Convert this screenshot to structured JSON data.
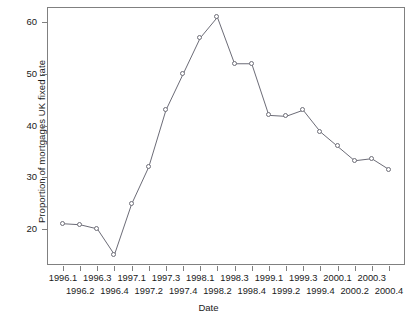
{
  "chart_data": {
    "type": "line",
    "title": "",
    "xlabel": "Date",
    "ylabel": "Proportion of mortgages UK fixed rate",
    "categories": [
      "1996.1",
      "1996.2",
      "1996.3",
      "1996.4",
      "1997.1",
      "1997.2",
      "1997.3",
      "1997.4",
      "1998.1",
      "1998.2",
      "1998.3",
      "1998.4",
      "1999.1",
      "1999.2",
      "1999.3",
      "1999.4",
      "2000.1",
      "2000.2",
      "2000.3",
      "2000.4"
    ],
    "values": [
      21.0,
      20.8,
      20.0,
      15.0,
      24.8,
      32.0,
      43.0,
      50.0,
      57.0,
      61.0,
      52.0,
      52.0,
      42.0,
      41.8,
      43.0,
      38.8,
      36.0,
      33.2,
      33.6,
      31.5
    ],
    "ylim": [
      13,
      63
    ],
    "yticks": [
      20,
      30,
      40,
      50,
      60
    ],
    "ytick_labels": [
      "20",
      "30",
      "40",
      "50",
      "60"
    ],
    "grid": false,
    "legend": "none",
    "marker": "open-circle",
    "line_style": "solid-thin",
    "series": [
      {
        "name": "Proportion of mortgages UK fixed rate",
        "values": [
          21.0,
          20.8,
          20.0,
          15.0,
          24.8,
          32.0,
          43.0,
          50.0,
          57.0,
          61.0,
          52.0,
          52.0,
          42.0,
          41.8,
          43.0,
          38.8,
          36.0,
          33.2,
          33.6,
          31.5
        ]
      }
    ]
  },
  "axis": {
    "x_row_top": [
      "1996.1",
      "1996.3",
      "1997.1",
      "1997.3",
      "1998.1",
      "1998.3",
      "1999.1",
      "1999.3",
      "2000.1",
      "2000.3"
    ],
    "x_row_bottom": [
      "1996.2",
      "1996.4",
      "1997.2",
      "1997.4",
      "1998.2",
      "1998.4",
      "1999.2",
      "1999.4",
      "2000.2",
      "2000.4"
    ]
  }
}
